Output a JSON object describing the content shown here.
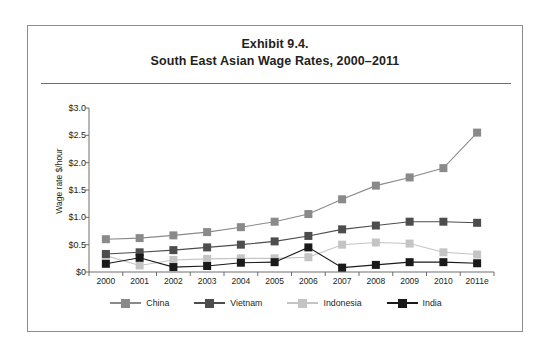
{
  "figure": {
    "title_line_1": "Exhibit 9.4.",
    "title_line_2": "South East Asian Wage Rates, 2000–2011"
  },
  "chart_data": {
    "type": "line",
    "title": "South East Asian Wage Rates, 2000–2011",
    "xlabel": "",
    "ylabel": "Wage rate $/hour",
    "categories": [
      "2000",
      "2001",
      "2002",
      "2003",
      "2004",
      "2005",
      "2006",
      "2007",
      "2008",
      "2009",
      "2010",
      "2011e"
    ],
    "ylim": [
      0,
      3.0
    ],
    "ytick_values": [
      0,
      0.5,
      1.0,
      1.5,
      2.0,
      2.5,
      3.0
    ],
    "ytick_labels": [
      "$0",
      "$0.5",
      "$1.0",
      "$1.5",
      "$2.0",
      "$2.5",
      "$3.0"
    ],
    "grid": false,
    "legend_position": "bottom",
    "marker": "square",
    "series": [
      {
        "name": "China",
        "color": "#8a8a8a",
        "values": [
          0.6,
          0.62,
          0.67,
          0.73,
          0.82,
          0.92,
          1.06,
          1.33,
          1.58,
          1.73,
          1.9,
          2.55
        ]
      },
      {
        "name": "Vietnam",
        "color": "#4d4d4d",
        "values": [
          0.33,
          0.36,
          0.4,
          0.45,
          0.5,
          0.56,
          0.66,
          0.78,
          0.85,
          0.92,
          0.92,
          0.9
        ]
      },
      {
        "name": "Indonesia",
        "color": "#c4c4c4",
        "values": [
          0.3,
          0.12,
          0.22,
          0.24,
          0.25,
          0.25,
          0.27,
          0.5,
          0.54,
          0.52,
          0.36,
          0.32
        ]
      },
      {
        "name": "India",
        "color": "#1a1a1a",
        "values": [
          0.15,
          0.26,
          0.09,
          0.11,
          0.17,
          0.18,
          0.45,
          0.08,
          0.13,
          0.18,
          0.18,
          0.16
        ]
      }
    ]
  },
  "axis": {
    "line_color": "#6e6e6e"
  }
}
